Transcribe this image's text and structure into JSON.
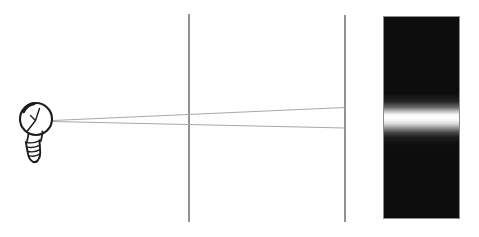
{
  "diagram": {
    "background_color": "#ffffff",
    "light_source": {
      "icon": "light-bulb-icon",
      "outline_color": "#1c1c1c",
      "glass_color": "#ffffff"
    },
    "rays": {
      "color": "#a9a9a9",
      "items": [
        {
          "name": "upper-ray"
        },
        {
          "name": "lower-ray"
        }
      ]
    },
    "barriers": {
      "color": "#6e6e6e",
      "items": [
        {
          "name": "first-slit-barrier"
        },
        {
          "name": "second-slit-barrier"
        }
      ]
    },
    "screen": {
      "edge_color": "#8c8c8c",
      "dark_color": "#0d0d0d",
      "band_color": "#ffffff",
      "gradient_stops": [
        {
          "offset": "0%",
          "color": "#0d0d0d"
        },
        {
          "offset": "38%",
          "color": "#0d0d0d"
        },
        {
          "offset": "42%",
          "color": "#242424"
        },
        {
          "offset": "45%",
          "color": "#6b6b6b"
        },
        {
          "offset": "47%",
          "color": "#c0c0c0"
        },
        {
          "offset": "48.5%",
          "color": "#f4f4f4"
        },
        {
          "offset": "50%",
          "color": "#ffffff"
        },
        {
          "offset": "51.5%",
          "color": "#f4f4f4"
        },
        {
          "offset": "53%",
          "color": "#dcdcdc"
        },
        {
          "offset": "55%",
          "color": "#9a9a9a"
        },
        {
          "offset": "57.5%",
          "color": "#474747"
        },
        {
          "offset": "60%",
          "color": "#1b1b1b"
        },
        {
          "offset": "64%",
          "color": "#0d0d0d"
        },
        {
          "offset": "100%",
          "color": "#0d0d0d"
        }
      ]
    }
  }
}
